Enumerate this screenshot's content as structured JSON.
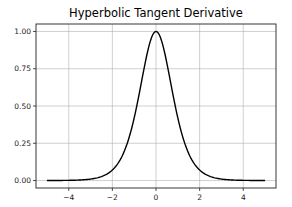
{
  "chart_data": {
    "type": "line",
    "title": "Hyperbolic Tangent Derivative",
    "xlabel": "",
    "ylabel": "",
    "xlim": [
      -5.5,
      5.5
    ],
    "ylim": [
      -0.05,
      1.05
    ],
    "grid": true,
    "legend": null,
    "x_ticks": [
      -4,
      -2,
      0,
      2,
      4
    ],
    "x_tick_labels": [
      "−4",
      "−2",
      "0",
      "2",
      "4"
    ],
    "y_ticks": [
      0.0,
      0.25,
      0.5,
      0.75,
      1.0
    ],
    "y_tick_labels": [
      "0.00",
      "0.25",
      "0.50",
      "0.75",
      "1.00"
    ],
    "series": [
      {
        "name": "1 - tanh(x)^2",
        "color": "#000000",
        "x": [
          -5,
          -4.5,
          -4,
          -3.5,
          -3,
          -2.5,
          -2,
          -1.75,
          -1.5,
          -1.25,
          -1,
          -0.75,
          -0.5,
          -0.25,
          0,
          0.25,
          0.5,
          0.75,
          1,
          1.25,
          1.5,
          1.75,
          2,
          2.5,
          3,
          3.5,
          4,
          4.5,
          5
        ],
        "values": [
          0.0002,
          0.0005,
          0.0013,
          0.0036,
          0.0099,
          0.0266,
          0.0707,
          0.1139,
          0.1807,
          0.278,
          0.42,
          0.5966,
          0.7864,
          0.9401,
          1.0,
          0.9401,
          0.7864,
          0.5966,
          0.42,
          0.278,
          0.1807,
          0.1139,
          0.0707,
          0.0266,
          0.0099,
          0.0036,
          0.0013,
          0.0005,
          0.0002
        ]
      }
    ]
  }
}
